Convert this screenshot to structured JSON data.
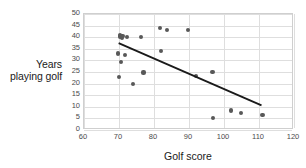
{
  "chart_data": {
    "type": "scatter",
    "title": "",
    "xlabel": "Golf score",
    "ylabel_lines": [
      "Years",
      "playing golf"
    ],
    "ylabel": "Years playing golf",
    "xlim": [
      60,
      120
    ],
    "ylim": [
      0,
      50
    ],
    "xticks": [
      60,
      70,
      80,
      90,
      100,
      110,
      120
    ],
    "yticks": [
      0,
      5,
      10,
      15,
      20,
      25,
      30,
      35,
      40,
      45,
      50
    ],
    "grid": true,
    "legend": "none",
    "marker_color": "#585858",
    "gridline_color": "#dedede",
    "trendline_color": "#1a1a1a",
    "points": [
      {
        "x": 69.8,
        "y": 33.0
      },
      {
        "x": 70.2,
        "y": 41.0
      },
      {
        "x": 70.4,
        "y": 40.3
      },
      {
        "x": 70.8,
        "y": 39.6
      },
      {
        "x": 71.0,
        "y": 40.6
      },
      {
        "x": 70.6,
        "y": 29.3
      },
      {
        "x": 69.9,
        "y": 23.0
      },
      {
        "x": 71.6,
        "y": 32.2
      },
      {
        "x": 72.3,
        "y": 40.1
      },
      {
        "x": 74.0,
        "y": 19.8
      },
      {
        "x": 76.4,
        "y": 40.2
      },
      {
        "x": 77.0,
        "y": 24.8
      },
      {
        "x": 81.7,
        "y": 44.0
      },
      {
        "x": 82.0,
        "y": 34.2
      },
      {
        "x": 83.8,
        "y": 43.0
      },
      {
        "x": 89.8,
        "y": 43.0
      },
      {
        "x": 91.9,
        "y": 23.2
      },
      {
        "x": 96.7,
        "y": 25.0
      },
      {
        "x": 96.8,
        "y": 5.2
      },
      {
        "x": 101.9,
        "y": 8.4
      },
      {
        "x": 104.8,
        "y": 7.3
      },
      {
        "x": 111.0,
        "y": 6.4
      }
    ],
    "trendline": {
      "x_start": 70.0,
      "y_start": 37.2,
      "x_end": 111.2,
      "y_end": 9.9
    }
  }
}
